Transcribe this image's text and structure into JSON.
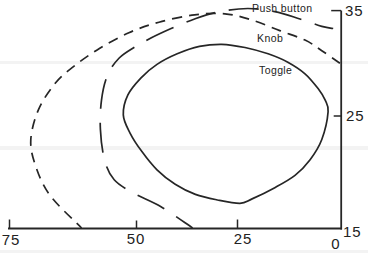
{
  "figure": {
    "width": 368,
    "height": 254,
    "background": "#ffffff",
    "ink_color": "#262626",
    "scan_bands": [
      {
        "y": 61,
        "h": 3
      },
      {
        "y": 146,
        "h": 4
      },
      {
        "y": 250,
        "h": 3
      }
    ],
    "scan_band_color": "#e9e9e9"
  },
  "chart_data": {
    "type": "line",
    "subtype": "open/closed contour curves comparing three control types",
    "title": "",
    "xlabel": "",
    "ylabel": "",
    "grid": false,
    "legend": "inline-labels",
    "x_axis": {
      "range": [
        75,
        0
      ],
      "reversed": true,
      "axis_y_px": 228.5,
      "ticks": [
        {
          "value": 75,
          "label": "75",
          "px": 9,
          "tick_len": 9
        },
        {
          "value": 50,
          "label": "50",
          "px": 136,
          "tick_len": 8
        },
        {
          "value": 25,
          "label": "25",
          "px": 237,
          "tick_len": 9
        },
        {
          "value": 0,
          "label": "0",
          "px": 342,
          "tick_len": 0
        }
      ]
    },
    "y_axis": {
      "range": [
        15,
        35
      ],
      "side": "right",
      "axis_x_px": 341.2,
      "ticks": [
        {
          "value": 35,
          "label": "35",
          "px": 10.6,
          "tick_len": 10
        },
        {
          "value": 25,
          "label": "25",
          "px": 116,
          "tick_len": 7.5
        },
        {
          "value": 15,
          "label": "15",
          "px": 228,
          "tick_len": 0
        }
      ]
    },
    "series": [
      {
        "name": "Push button",
        "style": "long-dash",
        "dash": [
          30,
          14
        ],
        "dash_offset": 10,
        "closed": false,
        "label_anchor_px": [
          252,
          12
        ],
        "points": [
          [
            36.0,
            15.0
          ],
          [
            43.8,
            16.9
          ],
          [
            50.4,
            18.1
          ],
          [
            54.3,
            19.3
          ],
          [
            56.2,
            21.1
          ],
          [
            57.0,
            23.8
          ],
          [
            56.8,
            26.5
          ],
          [
            55.6,
            28.9
          ],
          [
            53.3,
            30.5
          ],
          [
            50.4,
            31.5
          ],
          [
            46.3,
            32.4
          ],
          [
            41.3,
            33.3
          ],
          [
            35.5,
            34.2
          ],
          [
            29.3,
            34.9
          ],
          [
            22.4,
            35.2
          ],
          [
            16.0,
            34.9
          ],
          [
            10.0,
            34.2
          ],
          [
            4.8,
            33.5
          ],
          [
            2.1,
            33.3
          ]
        ]
      },
      {
        "name": "Knob",
        "style": "short-dash",
        "dash": [
          10,
          7
        ],
        "dash_offset": 3,
        "closed": false,
        "label_anchor_px": [
          257,
          42
        ],
        "points": [
          [
            60.7,
            15.0
          ],
          [
            66.9,
            17.9
          ],
          [
            69.8,
            20.6
          ],
          [
            70.7,
            22.9
          ],
          [
            69.2,
            25.6
          ],
          [
            65.9,
            28.1
          ],
          [
            62.0,
            29.8
          ],
          [
            57.2,
            31.4
          ],
          [
            51.4,
            32.9
          ],
          [
            44.3,
            33.9
          ],
          [
            35.5,
            34.6
          ],
          [
            28.0,
            34.7
          ],
          [
            21.4,
            34.1
          ],
          [
            14.8,
            33.1
          ],
          [
            8.8,
            32.2
          ],
          [
            4.8,
            31.2
          ],
          [
            0.5,
            30.0
          ]
        ]
      },
      {
        "name": "Toggle",
        "style": "solid",
        "dash": null,
        "dash_offset": 0,
        "closed": true,
        "label_anchor_px": [
          259,
          74
        ],
        "points": [
          [
            52.5,
            25.1
          ],
          [
            51.2,
            23.5
          ],
          [
            48.5,
            21.8
          ],
          [
            44.8,
            20.2
          ],
          [
            40.3,
            18.9
          ],
          [
            35.3,
            18.0
          ],
          [
            29.8,
            17.5
          ],
          [
            24.3,
            17.2
          ],
          [
            21.4,
            17.6
          ],
          [
            16.0,
            18.6
          ],
          [
            11.2,
            19.7
          ],
          [
            7.6,
            21.1
          ],
          [
            4.8,
            22.9
          ],
          [
            3.3,
            25.4
          ],
          [
            4.0,
            26.5
          ],
          [
            5.7,
            27.6
          ],
          [
            8.8,
            29.0
          ],
          [
            12.9,
            30.1
          ],
          [
            17.6,
            30.9
          ],
          [
            23.1,
            31.5
          ],
          [
            28.8,
            31.8
          ],
          [
            34.3,
            31.6
          ],
          [
            39.8,
            30.9
          ],
          [
            44.8,
            29.9
          ],
          [
            48.8,
            28.6
          ],
          [
            51.6,
            27.0
          ]
        ]
      }
    ]
  }
}
